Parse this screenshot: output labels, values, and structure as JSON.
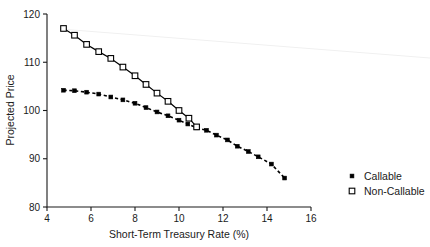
{
  "chart_data": {
    "type": "line",
    "title": "",
    "xlabel": "Short-Term Treasury Rate (%)",
    "ylabel": "Projected Price",
    "xlim": [
      4,
      16
    ],
    "ylim": [
      80,
      120
    ],
    "xticks": [
      4,
      6,
      8,
      10,
      12,
      14,
      16
    ],
    "xticklabels": [
      "4",
      "6",
      "8",
      "10",
      "12",
      "14",
      "16"
    ],
    "yticks": [
      80,
      90,
      100,
      110,
      120
    ],
    "yticklabels": [
      "80",
      "90",
      "100",
      "110",
      "120"
    ],
    "grid": false,
    "legend_position": "right",
    "series": [
      {
        "name": "Callable",
        "marker": "filled-square",
        "linestyle": "dashed",
        "color": "#000000",
        "x": [
          4.75,
          5.25,
          5.8,
          6.35,
          6.9,
          7.45,
          8.0,
          8.5,
          9.0,
          9.5,
          10.0,
          10.4,
          10.8,
          11.25,
          11.7,
          12.2,
          12.65,
          13.15,
          13.6,
          14.2,
          14.8
        ],
        "y": [
          104.2,
          104.1,
          103.8,
          103.4,
          102.8,
          102.2,
          101.5,
          100.6,
          99.7,
          98.9,
          98.0,
          97.2,
          96.4,
          95.9,
          94.9,
          93.9,
          92.6,
          91.5,
          90.4,
          88.9,
          86.0
        ]
      },
      {
        "name": "Non-Callable",
        "marker": "open-square",
        "linestyle": "solid",
        "color": "#000000",
        "x": [
          4.75,
          5.25,
          5.8,
          6.35,
          6.9,
          7.45,
          8.0,
          8.5,
          9.0,
          9.5,
          10.0,
          10.45,
          10.8
        ],
        "y": [
          117.0,
          115.6,
          113.7,
          112.2,
          110.8,
          109.0,
          107.2,
          105.4,
          103.6,
          101.9,
          100.0,
          98.4,
          96.6
        ]
      }
    ]
  },
  "legend": {
    "items": [
      {
        "label": "Callable",
        "marker": "filled-square"
      },
      {
        "label": "Non-Callable",
        "marker": "open-square"
      }
    ]
  }
}
